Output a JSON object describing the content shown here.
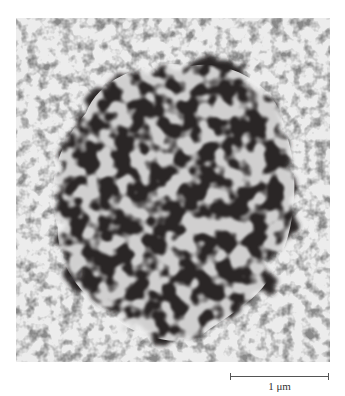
{
  "figure": {
    "type": "electron micrograph",
    "colors": {
      "background": "#e9e9e9",
      "dark_mass": "#2b2628",
      "speckle": "#6a6a6a",
      "page": "#ffffff"
    }
  },
  "scale_bar": {
    "label": "1 μm"
  }
}
